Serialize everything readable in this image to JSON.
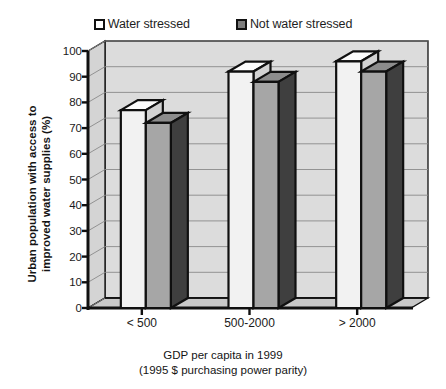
{
  "chart_data": {
    "type": "bar",
    "title": "",
    "categories": [
      "< 500",
      "500-2000",
      "> 2000"
    ],
    "series": [
      {
        "name": "Water stressed",
        "values": [
          77,
          92,
          96
        ],
        "color": "#ffffff"
      },
      {
        "name": "Not water stressed",
        "values": [
          72,
          88,
          92
        ],
        "color": "#a0a0a0"
      }
    ],
    "xlabel": "GDP per capita in 1999",
    "xlabel_line2": "(1995 $ purchasing power parity)",
    "ylabel": "Urban population with access to",
    "ylabel_line2": "improved water supplies (%)",
    "ylim": [
      0,
      100
    ],
    "ytick_values": [
      100,
      90,
      80,
      70,
      60,
      50,
      40,
      30,
      20,
      10,
      0
    ],
    "ytick_labels": [
      "100",
      "90",
      "80",
      "70",
      "60",
      "50",
      "40",
      "30",
      "20",
      "10",
      "0"
    ],
    "grid": true,
    "legend_position": "top",
    "projection": "3d"
  },
  "legend": {
    "items": [
      {
        "label": "Water stressed",
        "swatch": "white-square-swatch"
      },
      {
        "label": "Not water stressed",
        "swatch": "grey-square-swatch"
      }
    ]
  },
  "axes": {
    "y_title_line1": "Urban population with access to",
    "y_title_line2": "improved water supplies (%)",
    "x_title_line1": "GDP per capita in 1999",
    "x_title_line2": "(1995 $ purchasing power parity)"
  },
  "colors": {
    "series_1_face": "#f2f2f2",
    "series_1_side": "#d2d2d2",
    "series_1_top": "#fbfbfb",
    "series_2_face": "#a6a6a6",
    "series_2_side": "#3f3f3f",
    "series_2_top": "#8c8c8c",
    "outline": "#101010",
    "wall": "#dcdcdc",
    "floor": "#c9c9c9",
    "gridline": "#8a8a8a"
  }
}
